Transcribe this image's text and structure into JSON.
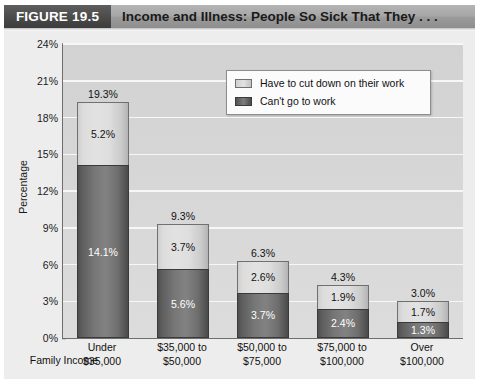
{
  "header": {
    "figure_tag": "FIGURE 19.5",
    "title": "Income and Illness: People So Sick That They . . ."
  },
  "axes": {
    "y_title": "Percentage",
    "x_title": "Family Income",
    "y_ticks": [
      "0%",
      "3%",
      "6%",
      "9%",
      "12%",
      "15%",
      "18%",
      "21%",
      "24%"
    ]
  },
  "legend": {
    "items": [
      {
        "label": "Have to cut down on their work",
        "swatch": "light"
      },
      {
        "label": "Can't go to work",
        "swatch": "dark"
      }
    ]
  },
  "chart_data": {
    "type": "bar",
    "subtype": "stacked",
    "title": "Income and Illness: People So Sick That They . . .",
    "xlabel": "Family Income",
    "ylabel": "Percentage",
    "ylim": [
      0,
      24
    ],
    "ytick_step": 3,
    "grid": true,
    "legend_position": "inside-top-right",
    "categories": [
      "Under $35,000",
      "$35,000 to $50,000",
      "$50,000 to $75,000",
      "$75,000 to $100,000",
      "Over $100,000"
    ],
    "category_lines": [
      [
        "Under",
        "$35,000"
      ],
      [
        "$35,000 to",
        "$50,000"
      ],
      [
        "$50,000 to",
        "$75,000"
      ],
      [
        "$75,000 to",
        "$100,000"
      ],
      [
        "Over",
        "$100,000"
      ]
    ],
    "series": [
      {
        "name": "Can't go to work",
        "color": "#767676",
        "values": [
          14.1,
          5.6,
          3.7,
          2.4,
          1.3
        ],
        "labels": [
          "14.1%",
          "5.6%",
          "3.7%",
          "2.4%",
          "1.3%"
        ]
      },
      {
        "name": "Have to cut down on their work",
        "color": "#dedede",
        "values": [
          5.2,
          3.7,
          2.6,
          1.9,
          1.7
        ],
        "labels": [
          "5.2%",
          "3.7%",
          "2.6%",
          "1.9%",
          "1.7%"
        ]
      }
    ],
    "totals": [
      19.3,
      9.3,
      6.3,
      4.3,
      3.0
    ],
    "total_labels": [
      "19.3%",
      "9.3%",
      "6.3%",
      "4.3%",
      "3.0%"
    ]
  }
}
